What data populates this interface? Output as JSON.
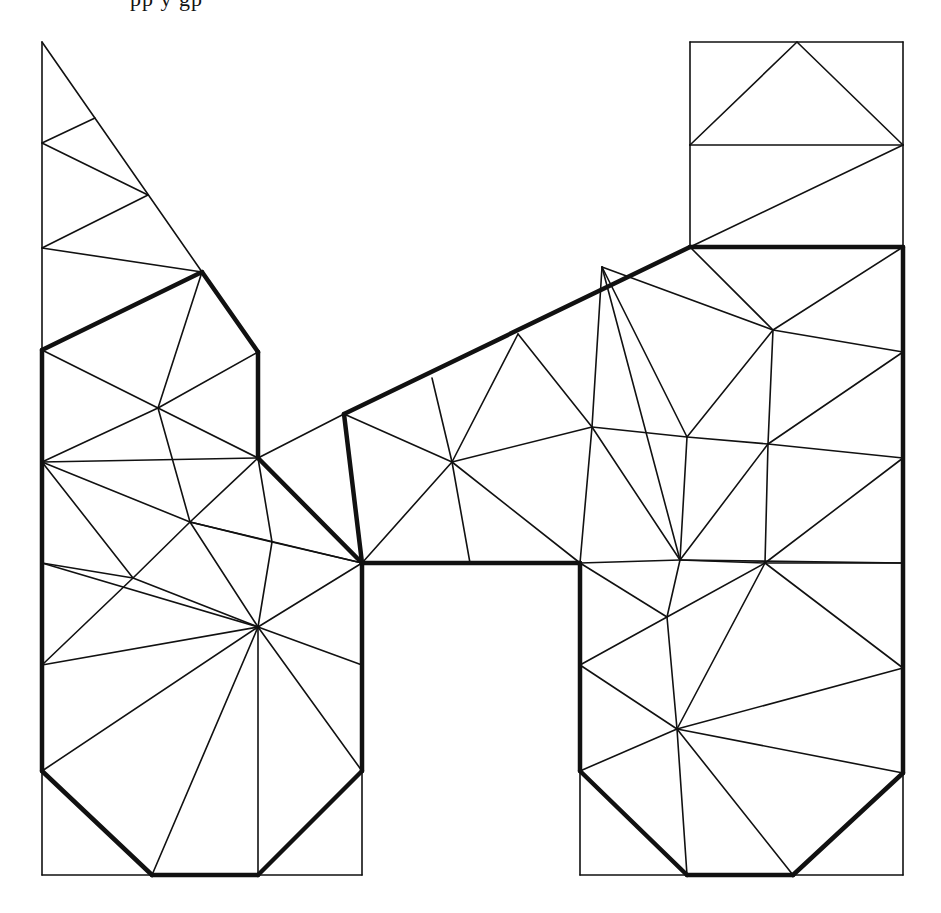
{
  "figure": {
    "cut_off_text_top": "pp          y                          gp",
    "stroke_color": "#111111",
    "background": "#ffffff"
  },
  "vertices": {
    "L0": [
      42,
      42
    ],
    "L1": [
      42,
      143
    ],
    "L2": [
      42,
      248
    ],
    "L3": [
      42,
      350
    ],
    "L4": [
      42,
      462
    ],
    "L5": [
      42,
      563
    ],
    "L6": [
      42,
      665
    ],
    "L7": [
      42,
      771
    ],
    "L8": [
      42,
      875
    ],
    "A": [
      95,
      118
    ],
    "B": [
      148,
      195
    ],
    "C": [
      202,
      272
    ],
    "D": [
      258,
      352
    ],
    "E": [
      258,
      458
    ],
    "P": [
      158,
      408
    ],
    "Q": [
      190,
      522
    ],
    "R": [
      133,
      578
    ],
    "S": [
      272,
      542
    ],
    "T": [
      258,
      627
    ],
    "M": [
      362,
      563
    ],
    "M1": [
      362,
      665
    ],
    "M2": [
      362,
      771
    ],
    "M3": [
      362,
      875
    ],
    "B1": [
      152,
      875
    ],
    "B2": [
      258,
      875
    ],
    "N0": [
      344,
      414
    ],
    "N1": [
      432,
      378
    ],
    "N2": [
      518,
      334
    ],
    "N3": [
      602,
      267
    ],
    "N4": [
      690,
      247
    ],
    "H": [
      452,
      462
    ],
    "I": [
      470,
      563
    ],
    "J": [
      592,
      427
    ],
    "K": [
      680,
      560
    ],
    "U": [
      580,
      563
    ],
    "R0": [
      690,
      42
    ],
    "R1": [
      797,
      42
    ],
    "R2": [
      903,
      42
    ],
    "R3": [
      690,
      145
    ],
    "R4": [
      903,
      145
    ],
    "R5": [
      903,
      247
    ],
    "R6": [
      903,
      352
    ],
    "R7": [
      903,
      458
    ],
    "R8": [
      903,
      563
    ],
    "R9": [
      903,
      668
    ],
    "R10": [
      903,
      773
    ],
    "R11": [
      903,
      875
    ],
    "V1": [
      773,
      330
    ],
    "V2": [
      687,
      437
    ],
    "V3": [
      768,
      444
    ],
    "V4": [
      765,
      563
    ],
    "W1": [
      667,
      617
    ],
    "W2": [
      580,
      665
    ],
    "W3": [
      677,
      729
    ],
    "W4": [
      580,
      771
    ],
    "X1": [
      687,
      875
    ],
    "X2": [
      793,
      875
    ],
    "X0": [
      580,
      875
    ]
  },
  "thick_edges": [
    [
      "L3",
      "C"
    ],
    [
      "C",
      "D"
    ],
    [
      "D",
      "E"
    ],
    [
      "E",
      "M"
    ],
    [
      "L3",
      "L7"
    ],
    [
      "L7",
      "B1"
    ],
    [
      "B1",
      "B2"
    ],
    [
      "B2",
      "M2"
    ],
    [
      "M2",
      "M"
    ],
    [
      "N0",
      "N4"
    ],
    [
      "N4",
      "R5"
    ],
    [
      "R5",
      "R10"
    ],
    [
      "R10",
      "X2"
    ],
    [
      "X2",
      "X1"
    ],
    [
      "X1",
      "W4"
    ],
    [
      "W4",
      "U"
    ],
    [
      "U",
      "M"
    ],
    [
      "M",
      "N0"
    ]
  ],
  "thin_edges": [
    [
      "L0",
      "L3"
    ],
    [
      "L0",
      "C"
    ],
    [
      "L1",
      "A"
    ],
    [
      "L1",
      "B"
    ],
    [
      "L2",
      "B"
    ],
    [
      "L2",
      "C"
    ],
    [
      "L3",
      "P"
    ],
    [
      "C",
      "P"
    ],
    [
      "D",
      "P"
    ],
    [
      "P",
      "E"
    ],
    [
      "P",
      "L4"
    ],
    [
      "P",
      "Q"
    ],
    [
      "L4",
      "E"
    ],
    [
      "L4",
      "Q"
    ],
    [
      "L4",
      "R"
    ],
    [
      "Q",
      "E"
    ],
    [
      "Q",
      "S"
    ],
    [
      "Q",
      "M"
    ],
    [
      "Q",
      "T"
    ],
    [
      "Q",
      "R"
    ],
    [
      "E",
      "S"
    ],
    [
      "S",
      "M"
    ],
    [
      "S",
      "T"
    ],
    [
      "R",
      "L5"
    ],
    [
      "R",
      "T"
    ],
    [
      "L5",
      "T"
    ],
    [
      "L6",
      "R"
    ],
    [
      "L6",
      "T"
    ],
    [
      "L7",
      "T"
    ],
    [
      "B1",
      "T"
    ],
    [
      "B2",
      "T"
    ],
    [
      "M2",
      "T"
    ],
    [
      "M1",
      "T"
    ],
    [
      "M",
      "T"
    ],
    [
      "L7",
      "L8"
    ],
    [
      "L8",
      "M3"
    ],
    [
      "M3",
      "M2"
    ],
    [
      "E",
      "N0"
    ],
    [
      "N0",
      "H"
    ],
    [
      "N1",
      "H"
    ],
    [
      "N2",
      "H"
    ],
    [
      "N2",
      "J"
    ],
    [
      "H",
      "M"
    ],
    [
      "H",
      "I"
    ],
    [
      "H",
      "J"
    ],
    [
      "H",
      "U"
    ],
    [
      "N3",
      "J"
    ],
    [
      "N3",
      "K"
    ],
    [
      "N3",
      "V2"
    ],
    [
      "J",
      "U"
    ],
    [
      "J",
      "K"
    ],
    [
      "J",
      "V2"
    ],
    [
      "N4",
      "V1"
    ],
    [
      "N3",
      "V1"
    ],
    [
      "V1",
      "R5"
    ],
    [
      "V1",
      "R6"
    ],
    [
      "V1",
      "V2"
    ],
    [
      "V1",
      "V3"
    ],
    [
      "V2",
      "V3"
    ],
    [
      "V2",
      "K"
    ],
    [
      "V3",
      "R6"
    ],
    [
      "V3",
      "R7"
    ],
    [
      "V3",
      "V4"
    ],
    [
      "V3",
      "K"
    ],
    [
      "K",
      "V4"
    ],
    [
      "V4",
      "R7"
    ],
    [
      "V4",
      "R8"
    ],
    [
      "V4",
      "W1"
    ],
    [
      "V4",
      "W3"
    ],
    [
      "V4",
      "R9"
    ],
    [
      "U",
      "K"
    ],
    [
      "K",
      "R8"
    ],
    [
      "U",
      "W1"
    ],
    [
      "K",
      "W1"
    ],
    [
      "W1",
      "W2"
    ],
    [
      "W1",
      "W3"
    ],
    [
      "W2",
      "W3"
    ],
    [
      "W3",
      "R9"
    ],
    [
      "W3",
      "R10"
    ],
    [
      "W3",
      "W4"
    ],
    [
      "W3",
      "X1"
    ],
    [
      "W3",
      "X2"
    ],
    [
      "W4",
      "X0"
    ],
    [
      "X0",
      "R11"
    ],
    [
      "R11",
      "R10"
    ],
    [
      "R0",
      "R2"
    ],
    [
      "R0",
      "R3"
    ],
    [
      "R2",
      "R4"
    ],
    [
      "R1",
      "R3"
    ],
    [
      "R1",
      "R4"
    ],
    [
      "R3",
      "R4"
    ],
    [
      "R3",
      "N4"
    ],
    [
      "R4",
      "R5"
    ],
    [
      "N4",
      "R4"
    ]
  ]
}
